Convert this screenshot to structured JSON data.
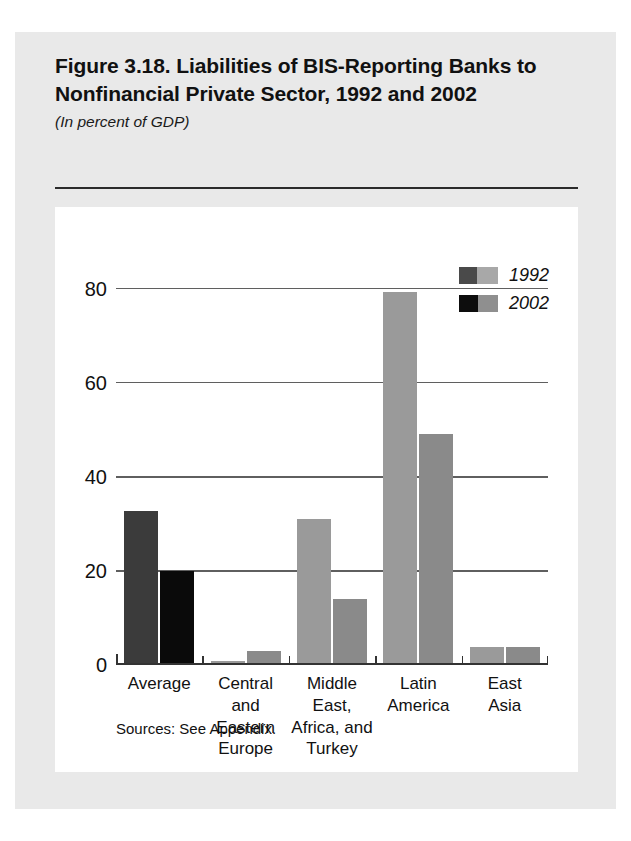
{
  "figure": {
    "title": "Figure 3.18. Liabilities of BIS-Reporting Banks to Nonfinancial Private Sector, 1992 and 2002",
    "subtitle": "(In percent of GDP)",
    "source_note": "Sources: See Appendix."
  },
  "chart_data": {
    "type": "bar",
    "title": "Figure 3.18. Liabilities of BIS-Reporting Banks to Nonfinancial Private Sector, 1992 and 2002",
    "subtitle": "(In percent of GDP)",
    "xlabel": "",
    "ylabel": "",
    "ylim": [
      0,
      85
    ],
    "yticks": [
      0,
      20,
      40,
      60,
      80
    ],
    "ytick_labels": [
      "0",
      "20",
      "40",
      "60",
      "80"
    ],
    "grid": true,
    "legend_position": "top-right",
    "categories": [
      "Average",
      "Central\nand\nEastern\nEurope",
      "Middle\nEast,\nAfrica, and\nTurkey",
      "Latin\nAmerica",
      "East\nAsia"
    ],
    "series": [
      {
        "name": "1992",
        "color": "#9a9a9a",
        "emphasis_color": "#3b3b3b",
        "values": [
          32.3,
          0.5,
          30.7,
          78.8,
          3.5
        ]
      },
      {
        "name": "2002",
        "color": "#8a8a8a",
        "emphasis_color": "#0a0a0a",
        "values": [
          19.6,
          2.5,
          13.6,
          48.6,
          3.5
        ]
      }
    ],
    "emphasized_category_index": 0
  },
  "legend": {
    "items": [
      {
        "label": "1992"
      },
      {
        "label": "2002"
      }
    ]
  }
}
